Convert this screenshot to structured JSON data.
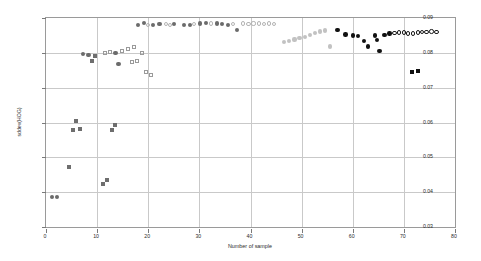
{
  "chart_data": {
    "type": "scatter",
    "title": "",
    "xlabel": "Number of sample",
    "ylabel": "sddev(HOG)",
    "xlim": [
      0,
      80
    ],
    "ylim": [
      0.03,
      0.09
    ],
    "xticks": [
      "0",
      "10",
      "20",
      "30",
      "40",
      "50",
      "60",
      "70",
      "80"
    ],
    "yticks": [
      "0.03",
      "0.04",
      "0.05",
      "0.06",
      "0.07",
      "0.08",
      "0.09"
    ],
    "grid": true,
    "legend": "none",
    "series": [
      {
        "name": "dark-gray filled circle",
        "marker": "filled-circle",
        "color": "#6b6b6b",
        "size": 4.2,
        "points": [
          [
            1.2,
            0.0385
          ],
          [
            2.2,
            0.0385
          ],
          [
            7.3,
            0.0797
          ],
          [
            8.3,
            0.0794
          ],
          [
            13.6,
            0.08
          ],
          [
            14.2,
            0.0767
          ],
          [
            18.0,
            0.088
          ],
          [
            19.2,
            0.0885
          ],
          [
            21.0,
            0.088
          ],
          [
            22.2,
            0.0882
          ],
          [
            25.0,
            0.0882
          ],
          [
            27.0,
            0.088
          ],
          [
            28.1,
            0.0881
          ],
          [
            30.2,
            0.0884
          ],
          [
            31.3,
            0.0886
          ],
          [
            33.4,
            0.0884
          ],
          [
            34.5,
            0.0882
          ],
          [
            35.6,
            0.0881
          ],
          [
            37.4,
            0.0866
          ]
        ]
      },
      {
        "name": "mid-gray filled square",
        "marker": "filled-square",
        "color": "#6e6e6e",
        "size": 4.0,
        "points": [
          [
            4.5,
            0.0472
          ],
          [
            5.2,
            0.0578
          ],
          [
            6.6,
            0.058
          ],
          [
            5.8,
            0.0605
          ],
          [
            9.0,
            0.0777
          ],
          [
            9.6,
            0.079
          ],
          [
            11.1,
            0.0424
          ],
          [
            12.0,
            0.0436
          ],
          [
            13.0,
            0.0578
          ],
          [
            13.4,
            0.0592
          ]
        ]
      },
      {
        "name": "open square",
        "marker": "open-square",
        "color": "#9a9a9a",
        "size": 4.0,
        "points": [
          [
            11.5,
            0.08
          ],
          [
            12.6,
            0.0802
          ],
          [
            14.8,
            0.0805
          ],
          [
            16.0,
            0.0812
          ],
          [
            16.8,
            0.0773
          ],
          [
            17.8,
            0.0776
          ],
          [
            17.2,
            0.0818
          ],
          [
            18.8,
            0.08
          ],
          [
            19.6,
            0.0745
          ],
          [
            20.6,
            0.0737
          ]
        ]
      },
      {
        "name": "open circle (light)",
        "marker": "open-circle",
        "color": "#b4b4b4",
        "size": 4.2,
        "points": [
          [
            20.0,
            0.0881
          ],
          [
            23.4,
            0.0882
          ],
          [
            24.2,
            0.088
          ],
          [
            29.0,
            0.0883
          ],
          [
            32.2,
            0.0884
          ],
          [
            36.6,
            0.0882
          ],
          [
            38.6,
            0.0884
          ],
          [
            39.6,
            0.0882
          ],
          [
            40.6,
            0.0884
          ],
          [
            41.6,
            0.0884
          ],
          [
            42.6,
            0.0883
          ],
          [
            43.6,
            0.0884
          ],
          [
            44.6,
            0.0882
          ]
        ]
      },
      {
        "name": "light-gray filled circle (descending run)",
        "marker": "filled-circle",
        "color": "#c2c2c2",
        "size": 4.2,
        "points": [
          [
            46.6,
            0.083
          ],
          [
            47.6,
            0.0833
          ],
          [
            48.6,
            0.0838
          ],
          [
            49.6,
            0.0842
          ],
          [
            50.6,
            0.0846
          ],
          [
            51.6,
            0.0851
          ],
          [
            52.6,
            0.0856
          ],
          [
            53.6,
            0.0861
          ],
          [
            54.6,
            0.0864
          ],
          [
            55.6,
            0.0818
          ]
        ]
      },
      {
        "name": "black filled circle",
        "marker": "filled-circle",
        "color": "#111111",
        "size": 4.4,
        "points": [
          [
            57.0,
            0.0865
          ],
          [
            58.6,
            0.0853
          ],
          [
            60.0,
            0.085
          ],
          [
            61.0,
            0.0848
          ],
          [
            62.2,
            0.0834
          ],
          [
            63.0,
            0.0818
          ],
          [
            64.4,
            0.085
          ],
          [
            64.8,
            0.0836
          ],
          [
            65.2,
            0.0806
          ],
          [
            66.2,
            0.0852
          ],
          [
            67.2,
            0.0855
          ]
        ]
      },
      {
        "name": "black open circle",
        "marker": "open-circle",
        "color": "#1a1a1a",
        "size": 4.4,
        "points": [
          [
            68.2,
            0.0857
          ],
          [
            69.0,
            0.0858
          ],
          [
            70.0,
            0.0858
          ],
          [
            70.8,
            0.0856
          ],
          [
            71.8,
            0.0855
          ],
          [
            72.8,
            0.0858
          ],
          [
            73.6,
            0.086
          ],
          [
            74.4,
            0.086
          ],
          [
            75.4,
            0.0861
          ],
          [
            76.4,
            0.0859
          ]
        ]
      },
      {
        "name": "black filled square",
        "marker": "filled-square",
        "color": "#111111",
        "size": 4.2,
        "points": [
          [
            71.6,
            0.0745
          ],
          [
            72.8,
            0.0748
          ]
        ]
      }
    ]
  }
}
